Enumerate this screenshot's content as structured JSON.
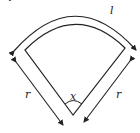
{
  "title": "c) Sector",
  "labels": {
    "arc_length": "l",
    "radius_left": "r",
    "radius_right": "r",
    "angle": "x"
  },
  "colors": {
    "stroke": "#222222",
    "background": "#ffffff"
  }
}
